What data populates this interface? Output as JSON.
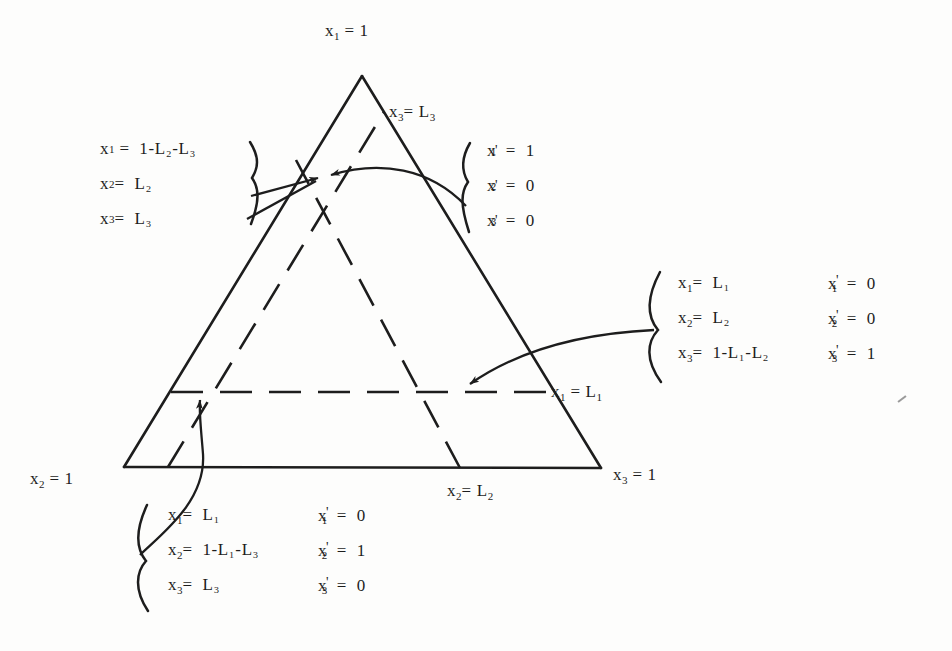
{
  "figure": {
    "type": "simplex-triangle-diagram",
    "vertex_labels": {
      "apex": "x1 = 1",
      "bottom_left": "x2 = 1",
      "bottom_right": "x3 = 1"
    },
    "line_labels": {
      "upper_right": "x3 = L3",
      "right_horizontal": "x1 = L1",
      "bottom": "x2 = L2"
    },
    "blocks": {
      "top_left": {
        "brace": "}",
        "rows": [
          {
            "lhs": "x",
            "sub": "1",
            "prime": false,
            "eq": "=",
            "rhs": "1-L₂-L₃"
          },
          {
            "lhs": "x",
            "sub": "2",
            "prime": false,
            "eq": "=",
            "rhs": "L₂"
          },
          {
            "lhs": "x",
            "sub": "3",
            "prime": false,
            "eq": "=",
            "rhs": "L₃"
          }
        ]
      },
      "top_right": {
        "brace": "{",
        "rows": [
          {
            "lhs": "x",
            "sub": "1",
            "prime": true,
            "eq": "=",
            "rhs": "1"
          },
          {
            "lhs": "x",
            "sub": "2",
            "prime": true,
            "eq": "=",
            "rhs": "0"
          },
          {
            "lhs": "x",
            "sub": "3",
            "prime": true,
            "eq": "=",
            "rhs": "0"
          }
        ]
      },
      "right": {
        "brace": "{",
        "rows": [
          {
            "lhs": "x",
            "sub": "1",
            "prime": false,
            "eq": "=",
            "rhs": "L₁",
            "lhs2": "x",
            "sub2": "1",
            "prime2": true,
            "eq2": "=",
            "rhs2": "0"
          },
          {
            "lhs": "x",
            "sub": "2",
            "prime": false,
            "eq": "=",
            "rhs": "L₂",
            "lhs2": "x",
            "sub2": "2",
            "prime2": true,
            "eq2": "=",
            "rhs2": "0"
          },
          {
            "lhs": "x",
            "sub": "3",
            "prime": false,
            "eq": "=",
            "rhs": "1-L₁-L₂",
            "lhs2": "x",
            "sub2": "3",
            "prime2": true,
            "eq2": "=",
            "rhs2": "1"
          }
        ]
      },
      "bottom": {
        "brace": "{",
        "rows": [
          {
            "lhs": "x",
            "sub": "1",
            "prime": false,
            "eq": "=",
            "rhs": "L₁",
            "lhs2": "x",
            "sub2": "1",
            "prime2": true,
            "eq2": "=",
            "rhs2": "0"
          },
          {
            "lhs": "x",
            "sub": "2",
            "prime": false,
            "eq": "=",
            "rhs": "1-L₁-L₃",
            "lhs2": "x",
            "sub2": "2",
            "prime2": true,
            "eq2": "=",
            "rhs2": "1"
          },
          {
            "lhs": "x",
            "sub": "3",
            "prime": false,
            "eq": "=",
            "rhs": "L₃",
            "lhs2": "x",
            "sub2": "3",
            "prime2": true,
            "eq2": "=",
            "rhs2": "0"
          }
        ]
      }
    },
    "colors": {
      "ink": "#1d1d1d",
      "paper": "#fdfdfc",
      "faint": "#8d8d8d"
    }
  },
  "labels": {
    "apex": "x",
    "apex_sub": "1",
    "apex_eq": "= 1",
    "bl": "x",
    "bl_sub": "2",
    "bl_eq": "= 1",
    "br": "x",
    "br_sub": "3",
    "br_eq": "= 1",
    "l3": "x",
    "l3_sub": "3",
    "l3_eq": "= L",
    "l3_sub2": "3",
    "l1": "x",
    "l1_sub": "1",
    "l1_eq": "= L",
    "l1_sub2": "1",
    "l2": "x",
    "l2_sub": "2",
    "l2_eq": "= L",
    "l2_sub2": "2"
  },
  "caption": {
    "text": ""
  }
}
